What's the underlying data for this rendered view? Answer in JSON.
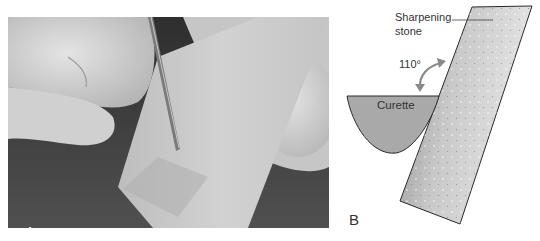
{
  "figure": {
    "panel_a": {
      "label": "A",
      "description": "Photograph of fingers holding a curette against a sharpening stone"
    },
    "panel_b": {
      "label": "B",
      "labels": {
        "sharpening_line1": "Sharpening",
        "sharpening_line2": "stone",
        "angle": "110°",
        "curette": "Curette"
      },
      "colors": {
        "curette_fill": "#a9a9a9",
        "stone_light": "#e6e6e6",
        "stone_dark": "#8e8e8e",
        "outline": "#2a2a2a"
      }
    }
  }
}
